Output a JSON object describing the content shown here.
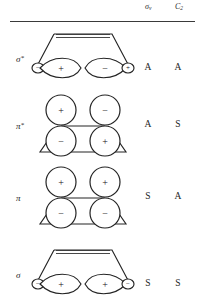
{
  "header": {
    "col_sigma_v": "σ",
    "col_sigma_v_sub": "v",
    "col_c2": "C",
    "col_c2_sub": "2"
  },
  "rows": [
    {
      "key": "sigma-star",
      "label": "σ",
      "label_star": "*",
      "sigma_v": "A",
      "c2": "A",
      "orbital_type": "sigma-antibonding",
      "frame": "trapezoid-top-narrow-with-double-bar",
      "lobes": [
        {
          "position": "outer-left",
          "size": "small",
          "sign": "−"
        },
        {
          "position": "inner-left",
          "size": "large",
          "sign": "+"
        },
        {
          "position": "inner-right",
          "size": "large",
          "sign": "−"
        },
        {
          "position": "outer-right",
          "size": "small",
          "sign": "+"
        }
      ]
    },
    {
      "key": "pi-star",
      "label": "π",
      "label_star": "*",
      "sigma_v": "A",
      "c2": "S",
      "orbital_type": "pi-antibonding",
      "frame": "trapezoid-bottom-with-bond-line",
      "lobes": [
        {
          "position": "top-left",
          "size": "circle",
          "sign": "+"
        },
        {
          "position": "top-right",
          "size": "circle",
          "sign": "−"
        },
        {
          "position": "bottom-left",
          "size": "circle",
          "sign": "−"
        },
        {
          "position": "bottom-right",
          "size": "circle",
          "sign": "+"
        }
      ]
    },
    {
      "key": "pi",
      "label": "π",
      "label_star": "",
      "sigma_v": "S",
      "c2": "A",
      "orbital_type": "pi-bonding",
      "frame": "trapezoid-bottom-with-bond-line",
      "lobes": [
        {
          "position": "top-left",
          "size": "circle",
          "sign": "+"
        },
        {
          "position": "top-right",
          "size": "circle",
          "sign": "+"
        },
        {
          "position": "bottom-left",
          "size": "circle",
          "sign": "−"
        },
        {
          "position": "bottom-right",
          "size": "circle",
          "sign": "−"
        }
      ]
    },
    {
      "key": "sigma",
      "label": "σ",
      "label_star": "",
      "sigma_v": "S",
      "c2": "S",
      "orbital_type": "sigma-bonding",
      "frame": "trapezoid-top-narrow-with-double-bar",
      "lobes": [
        {
          "position": "outer-left",
          "size": "small",
          "sign": "−"
        },
        {
          "position": "inner-left",
          "size": "large",
          "sign": "+"
        },
        {
          "position": "inner-right",
          "size": "large",
          "sign": "+"
        },
        {
          "position": "outer-right",
          "size": "small",
          "sign": "−"
        }
      ]
    }
  ],
  "colors": {
    "ink": "#242424",
    "paper": "#ffffff"
  }
}
